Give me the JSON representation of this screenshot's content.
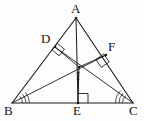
{
  "figure": {
    "kind": "geometry-diagram",
    "width": 144,
    "height": 121,
    "background_color": "#fdfdfd",
    "stroke_color": "#1a1a1a",
    "label_color": "#141414"
  },
  "points": {
    "A": {
      "label": "A",
      "x": 76,
      "y": 18
    },
    "B": {
      "label": "B",
      "x": 12,
      "y": 103
    },
    "C": {
      "label": "C",
      "x": 133,
      "y": 103
    },
    "D": {
      "label": "D",
      "x": 55,
      "y": 47
    },
    "E": {
      "label": "E",
      "x": 78,
      "y": 103
    },
    "F": {
      "label": "F",
      "x": 106,
      "y": 55
    },
    "I": {
      "label": "I",
      "x": 79,
      "y": 67
    }
  },
  "segments": [
    {
      "name": "side-AB",
      "from": "A",
      "to": "B"
    },
    {
      "name": "side-AC",
      "from": "A",
      "to": "C"
    },
    {
      "name": "side-BC",
      "from": "B",
      "to": "C"
    },
    {
      "name": "cevian-AE",
      "from": "A",
      "to": "E"
    },
    {
      "name": "bisector-BF",
      "from": "B",
      "to": "F"
    },
    {
      "name": "bisector-CD",
      "from": "C",
      "to": "D"
    },
    {
      "name": "inradius-ID",
      "from": "I",
      "to": "D"
    },
    {
      "name": "inradius-IE",
      "from": "I",
      "to": "E"
    },
    {
      "name": "inradius-IF",
      "from": "I",
      "to": "F"
    }
  ],
  "right_angle_marks": [
    {
      "name": "right-angle-at-D",
      "at": "D",
      "size": 8
    },
    {
      "name": "right-angle-at-E",
      "at": "E",
      "size": 9
    },
    {
      "name": "right-angle-at-F",
      "at": "F",
      "size": 8
    }
  ],
  "angle_arc_marks": [
    {
      "name": "angle-arcs-at-B",
      "at": "B",
      "count": 3
    },
    {
      "name": "angle-arcs-at-C",
      "at": "C",
      "count": 3
    }
  ]
}
